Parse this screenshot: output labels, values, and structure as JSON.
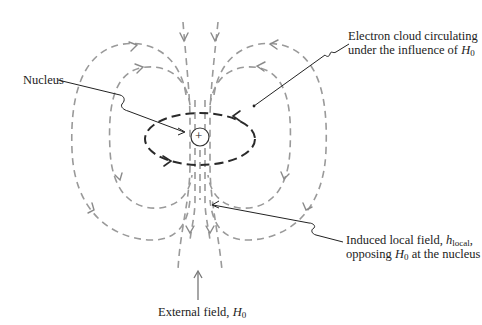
{
  "figure": {
    "labels": {
      "nucleus": "Nucleus",
      "nucleus_symbol": "+",
      "electron_cloud_line1": "Electron cloud circulating",
      "electron_cloud_line2_prefix": "under the influence of ",
      "electron_cloud_var": "H",
      "electron_cloud_sub": "0",
      "induced_line1_prefix": "Induced local field, ",
      "induced_var": "h",
      "induced_sub": "local",
      "induced_line1_suffix": ",",
      "induced_line2_prefix": "opposing ",
      "induced_line2_var": "H",
      "induced_line2_sub": "0",
      "induced_line2_suffix": " at the nucleus",
      "external_prefix": "External field, ",
      "external_var": "H",
      "external_sub": "0"
    },
    "colors": {
      "field_lines": "#9a9a9a",
      "electron_cloud": "#2a2a2a",
      "text": "#222222",
      "background": "#ffffff"
    }
  }
}
